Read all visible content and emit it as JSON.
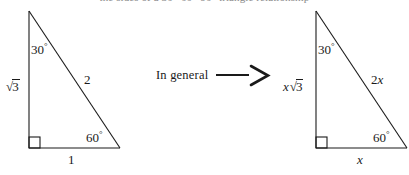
{
  "heading": {
    "text": "the sides of a 30°-60°-90° triangle relationship",
    "visible": "clipped-at-top"
  },
  "connector": {
    "label": "In general",
    "arrow_glyph": "—>",
    "arrow_name": "implies-arrow"
  },
  "figures": [
    {
      "id": "specific-triangle",
      "caption": "30-60-90 triangle with unit short leg",
      "geometry": {
        "apex": [
          29,
          11
        ],
        "right_angle_vertex": [
          29,
          148
        ],
        "base_vertex": [
          120,
          148
        ],
        "right_angle_box_size": 11
      },
      "labels": {
        "angle_top": "30",
        "angle_top_unit": "°",
        "angle_bottom": "60",
        "angle_bottom_unit": "°",
        "vertical_leg": "√3",
        "vertical_leg_radicand": "3",
        "hypotenuse": "2",
        "horizontal_leg": "1"
      }
    },
    {
      "id": "general-triangle",
      "caption": "30-60-90 triangle scaled by x",
      "geometry": {
        "apex": [
          316,
          11
        ],
        "right_angle_vertex": [
          316,
          148
        ],
        "base_vertex": [
          407,
          148
        ],
        "right_angle_box_size": 11
      },
      "labels": {
        "angle_top": "30",
        "angle_top_unit": "°",
        "angle_bottom": "60",
        "angle_bottom_unit": "°",
        "vertical_leg_coef": "x",
        "vertical_leg_radicand": "3",
        "hypotenuse_coef": "2",
        "hypotenuse_var": "x",
        "horizontal_leg": "x"
      }
    }
  ],
  "colors": {
    "stroke": "#1a1a1a",
    "background": "#ffffff",
    "faint_text": "#8a8a8a"
  }
}
